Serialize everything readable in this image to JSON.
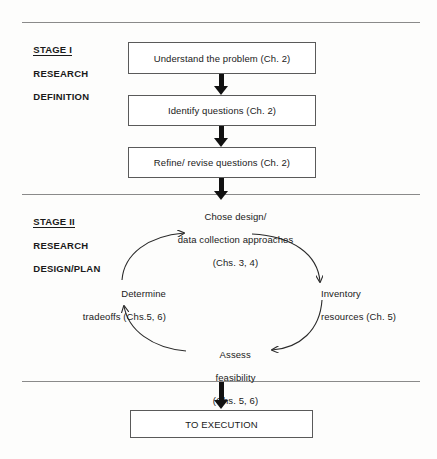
{
  "figure": {
    "type": "flowchart-with-cycle"
  },
  "stages": [
    {
      "id": "stage-1",
      "title": "STAGE I",
      "line2": "RESEARCH",
      "line3": "DEFINITION"
    },
    {
      "id": "stage-2",
      "title": "STAGE II",
      "line2": "RESEARCH",
      "line3": "DESIGN/PLAN"
    }
  ],
  "boxes": [
    {
      "id": "understand",
      "label": "Understand the problem (Ch. 2)"
    },
    {
      "id": "identify",
      "label": "Identify questions (Ch. 2)"
    },
    {
      "id": "refine",
      "label": "Refine/ revise questions (Ch. 2)"
    },
    {
      "id": "execution",
      "label": "TO EXECUTION"
    }
  ],
  "cycle": {
    "direction": "clockwise",
    "nodes": [
      {
        "id": "chose-design",
        "position": "top",
        "line1": "Chose design/",
        "line2": "data collection approaches",
        "line3": "(Chs. 3, 4)"
      },
      {
        "id": "inventory-resources",
        "position": "right",
        "line1": "Inventory",
        "line2": "resources (Ch. 5)",
        "line3": ""
      },
      {
        "id": "assess-feasibility",
        "position": "bottom",
        "line1": "Assess",
        "line2": "feasibility",
        "line3": "(Chs. 5, 6)"
      },
      {
        "id": "determine-tradeoffs",
        "position": "left",
        "line1": "Determine",
        "line2": "tradeoffs (Chs.5, 6)",
        "line3": ""
      }
    ]
  },
  "colors": {
    "ink": "#1a1a1a",
    "arrow": "#111111",
    "box_border": "#5a5a5a",
    "divider": "#8a8a8a",
    "background": "#fdfdfc"
  }
}
